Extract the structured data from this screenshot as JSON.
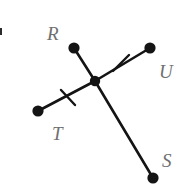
{
  "figure": {
    "kind": "geometry-diagram",
    "canvas": {
      "width": 183,
      "height": 190,
      "background": "#ffffff"
    },
    "style": {
      "line_color": "#141414",
      "label_color": "#6f6f6f",
      "dot_color": "#141414",
      "line_width": 2.6,
      "label_font_size": 19
    },
    "center_point": {
      "name": "center-vertex",
      "x": 95,
      "y": 81,
      "radius": 5.2
    },
    "points": [
      {
        "id": "R",
        "label": "R",
        "x": 74,
        "y": 48,
        "radius": 5.6,
        "label_x": 47,
        "label_y": 40
      },
      {
        "id": "U",
        "label": "U",
        "x": 150,
        "y": 48,
        "radius": 5.6,
        "label_x": 159,
        "label_y": 78
      },
      {
        "id": "T",
        "label": "T",
        "x": 38,
        "y": 111,
        "radius": 5.6,
        "label_x": 52,
        "label_y": 140
      },
      {
        "id": "S",
        "label": "S",
        "x": 153,
        "y": 178,
        "radius": 5.6,
        "label_x": 162,
        "label_y": 167
      }
    ],
    "segments": [
      {
        "id": "center-R",
        "from": "center",
        "to": "R",
        "x1": 95,
        "y1": 81,
        "x2": 74,
        "y2": 48,
        "ticks": 0
      },
      {
        "id": "center-U",
        "from": "center",
        "to": "U",
        "x1": 95,
        "y1": 81,
        "x2": 150,
        "y2": 48,
        "ticks": 1
      },
      {
        "id": "center-T",
        "from": "center",
        "to": "T",
        "x1": 95,
        "y1": 81,
        "x2": 38,
        "y2": 111,
        "ticks": 1
      },
      {
        "id": "center-S",
        "from": "center",
        "to": "S",
        "x1": 95,
        "y1": 81,
        "x2": 153,
        "y2": 178,
        "ticks": 0
      }
    ],
    "tick_marks": [
      {
        "id": "tick-on-center-U",
        "on_segment": "center-U",
        "x1": 113,
        "y1": 71,
        "x2": 129,
        "y2": 55
      },
      {
        "id": "tick-on-center-T",
        "on_segment": "center-T",
        "x1": 61,
        "y1": 90,
        "x2": 75,
        "y2": 105
      }
    ],
    "edge_artifact": {
      "id": "left-edge-mark",
      "x": 0,
      "y": 28,
      "width": 2,
      "height": 7
    }
  }
}
